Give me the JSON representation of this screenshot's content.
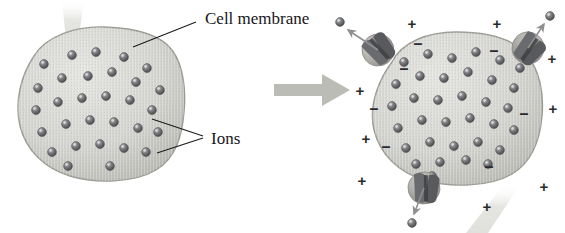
{
  "figure": {
    "type": "biology-diagram",
    "background_color": "#ffffff"
  },
  "labels": {
    "cell_membrane": "Cell membrane",
    "ions": "Ions"
  },
  "colors": {
    "cytoplasm": "#cfcfcb",
    "cytoplasm_light": "#e0e0dc",
    "membrane_rim": "#9a9a95",
    "ion_fill": "#77787a",
    "ion_dark": "#4c4d50",
    "ion_highlight": "#c9cacb",
    "channel_body": "#b0b0ab",
    "channel_dark": "#5f6063",
    "transition_arrow": "#b9b9b4",
    "beam": "#ededea",
    "text": "#17161a",
    "sign": "#2a2a2e"
  },
  "cells": {
    "left": {
      "name": "resting-cell",
      "center": [
        98,
        108
      ],
      "ion_count": 30,
      "has_channels": false,
      "ions": [
        [
          44,
          64
        ],
        [
          72,
          55
        ],
        [
          96,
          52
        ],
        [
          124,
          57
        ],
        [
          147,
          68
        ],
        [
          38,
          88
        ],
        [
          62,
          78
        ],
        [
          88,
          76
        ],
        [
          112,
          72
        ],
        [
          136,
          82
        ],
        [
          160,
          90
        ],
        [
          36,
          110
        ],
        [
          58,
          102
        ],
        [
          82,
          98
        ],
        [
          106,
          96
        ],
        [
          130,
          100
        ],
        [
          152,
          110
        ],
        [
          42,
          132
        ],
        [
          66,
          124
        ],
        [
          90,
          120
        ],
        [
          114,
          122
        ],
        [
          138,
          128
        ],
        [
          158,
          132
        ],
        [
          52,
          152
        ],
        [
          76,
          146
        ],
        [
          100,
          144
        ],
        [
          124,
          148
        ],
        [
          146,
          152
        ],
        [
          68,
          166
        ],
        [
          110,
          166
        ]
      ]
    },
    "right": {
      "name": "stimulated-cell",
      "center": [
        455,
        110
      ],
      "ion_count": 34,
      "has_channels": true,
      "ions": [
        [
          404,
          62
        ],
        [
          428,
          54
        ],
        [
          452,
          58
        ],
        [
          476,
          52
        ],
        [
          500,
          60
        ],
        [
          520,
          68
        ],
        [
          396,
          84
        ],
        [
          420,
          76
        ],
        [
          444,
          78
        ],
        [
          468,
          72
        ],
        [
          492,
          80
        ],
        [
          514,
          88
        ],
        [
          392,
          106
        ],
        [
          414,
          98
        ],
        [
          438,
          100
        ],
        [
          462,
          96
        ],
        [
          486,
          102
        ],
        [
          508,
          108
        ],
        [
          398,
          128
        ],
        [
          422,
          120
        ],
        [
          446,
          122
        ],
        [
          470,
          118
        ],
        [
          494,
          124
        ],
        [
          514,
          130
        ],
        [
          406,
          148
        ],
        [
          430,
          142
        ],
        [
          454,
          146
        ],
        [
          478,
          142
        ],
        [
          500,
          150
        ],
        [
          416,
          164
        ],
        [
          440,
          162
        ],
        [
          466,
          160
        ],
        [
          488,
          164
        ],
        [
          432,
          176
        ]
      ]
    }
  },
  "channels": [
    {
      "name": "channel-upper-left",
      "position": [
        378,
        50
      ],
      "rotation": -38,
      "ion_exit": [
        340,
        22
      ],
      "arrow_to": [
        348,
        30
      ],
      "state": "open"
    },
    {
      "name": "channel-upper-right",
      "position": [
        528,
        48
      ],
      "rotation": 40,
      "ion_exit": [
        550,
        16
      ],
      "arrow_to": [
        544,
        24
      ],
      "state": "open"
    },
    {
      "name": "channel-bottom",
      "position": [
        424,
        188
      ],
      "rotation": 4,
      "ion_exit": [
        412,
        223
      ],
      "arrow_to": [
        414,
        214
      ],
      "state": "open"
    }
  ],
  "charge_signs": {
    "outside_label": "+",
    "inside_label": "–",
    "outside": [
      [
        412,
        25
      ],
      [
        497,
        25
      ],
      [
        360,
        92
      ],
      [
        366,
        140
      ],
      [
        362,
        182
      ],
      [
        553,
        110
      ],
      [
        544,
        188
      ],
      [
        487,
        208
      ],
      [
        552,
        60
      ]
    ],
    "inside": [
      [
        418,
        45
      ],
      [
        494,
        52
      ],
      [
        374,
        110
      ],
      [
        386,
        148
      ],
      [
        524,
        115
      ],
      [
        489,
        168
      ],
      [
        404,
        70
      ]
    ]
  },
  "transition_arrow": {
    "name": "transition-arrow",
    "from": [
      274,
      88
    ],
    "to": [
      350,
      88
    ],
    "direction": "right"
  },
  "beams": [
    {
      "name": "pointer-beam-left",
      "points": "62,0 84,0 78,42 66,40"
    },
    {
      "name": "pointer-beam-right",
      "points": "488,233 468,233 505,186 516,192"
    }
  ],
  "leaders": {
    "cell_membrane": {
      "from": [
        196,
        22
      ],
      "to": [
        134,
        46
      ]
    },
    "ions_1": {
      "from": [
        202,
        136
      ],
      "to": [
        152,
        120
      ]
    },
    "ions_2": {
      "from": [
        202,
        138
      ],
      "to": [
        158,
        152
      ]
    }
  },
  "label_positions": {
    "cell_membrane": [
      201,
      18
    ],
    "ions": [
      208,
      139
    ]
  }
}
